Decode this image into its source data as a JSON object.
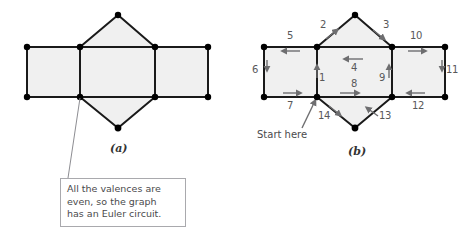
{
  "figures": {
    "a": {
      "label": "(a)",
      "callout": {
        "line1": "All the valences are",
        "line2": "even, so the graph",
        "line3": "has an Euler circuit."
      }
    },
    "b": {
      "label": "(b)",
      "start_label": "Start here",
      "edges": [
        {
          "num": "1",
          "dir": "up"
        },
        {
          "num": "2",
          "dir": "up-right"
        },
        {
          "num": "3",
          "dir": "down-right"
        },
        {
          "num": "4",
          "dir": "left"
        },
        {
          "num": "5",
          "dir": "left"
        },
        {
          "num": "6",
          "dir": "down"
        },
        {
          "num": "7",
          "dir": "right"
        },
        {
          "num": "8",
          "dir": "right"
        },
        {
          "num": "9",
          "dir": "up"
        },
        {
          "num": "10",
          "dir": "right"
        },
        {
          "num": "11",
          "dir": "down"
        },
        {
          "num": "12",
          "dir": "left"
        },
        {
          "num": "13",
          "dir": "up-left"
        },
        {
          "num": "14",
          "dir": "down-right"
        }
      ]
    }
  },
  "colors": {
    "face_fill": "#f0f0f0",
    "edge_stroke": "#1a1a1a",
    "vertex_fill": "#000000",
    "number_text": "#58585a",
    "callout_border": "#a9a9ad",
    "callout_text": "#4a4a4c",
    "arrow_gray": "#6e6e70",
    "leader_line": "#8d8d92"
  }
}
